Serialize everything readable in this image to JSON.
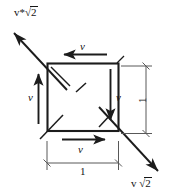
{
  "figure": {
    "background_color": "#ffffff",
    "stroke_color": "#1c1c1c",
    "dimension_stroke_color": "#585858",
    "text_color": "#151515",
    "width": 176,
    "height": 196
  },
  "shape": {
    "name": "square",
    "side_length_label": "1",
    "left": 47,
    "top": 63,
    "right": 119,
    "bottom": 131
  },
  "edge_vectors": [
    {
      "id": "top",
      "label": "v",
      "direction": "left",
      "position": "above-top-edge"
    },
    {
      "id": "right",
      "label": "v",
      "direction": "down",
      "position": "inside-right-edge"
    },
    {
      "id": "bottom",
      "label": "v",
      "direction": "right",
      "position": "below-bottom-edge"
    },
    {
      "id": "left",
      "label": "v",
      "direction": "up",
      "position": "outside-left-edge"
    }
  ],
  "diagonal_vectors": [
    {
      "id": "upper-left",
      "label_parts": {
        "prefix": "v*",
        "radical": "√",
        "radicand": "2"
      },
      "label_text": "v*√2",
      "direction": "up-left",
      "from": {
        "x": 67,
        "y": 90
      },
      "to": {
        "x": 13,
        "y": 32
      }
    },
    {
      "id": "lower-right",
      "label_parts": {
        "prefix": "v ",
        "radical": "√",
        "radicand": "2"
      },
      "label_text": "v √2",
      "direction": "down-right",
      "from": {
        "x": 99,
        "y": 107
      },
      "to": {
        "x": 159,
        "y": 172
      }
    }
  ],
  "dimensions": [
    {
      "id": "bottom-width",
      "label": "1",
      "orientation": "horizontal",
      "from": {
        "x": 47,
        "y": 163
      },
      "to": {
        "x": 118,
        "y": 163
      }
    },
    {
      "id": "right-height",
      "label": "1",
      "orientation": "vertical",
      "from": {
        "x": 146,
        "y": 66
      },
      "to": {
        "x": 146,
        "y": 134
      }
    }
  ],
  "corner_ticks": [
    {
      "id": "top-left-inner",
      "from": {
        "x": 51,
        "y": 67
      },
      "to": {
        "x": 70,
        "y": 86
      }
    },
    {
      "id": "center-dash",
      "from": {
        "x": 77,
        "y": 91
      },
      "to": {
        "x": 85,
        "y": 84
      }
    },
    {
      "id": "bottom-left-inner",
      "from": {
        "x": 40,
        "y": 138
      },
      "to": {
        "x": 62,
        "y": 116
      }
    },
    {
      "id": "bottom-right-inner",
      "from": {
        "x": 99,
        "y": 126
      },
      "to": {
        "x": 112,
        "y": 113
      }
    },
    {
      "id": "top-right-outer",
      "from": {
        "x": 118,
        "y": 62
      },
      "to": {
        "x": 124,
        "y": 56
      }
    }
  ],
  "labels": {
    "top_v": "v",
    "right_v": "v",
    "bottom_v": "v",
    "left_v": "v",
    "bottom_dimension": "1",
    "right_dimension": "1",
    "upper_left_diagonal_prefix": "v*",
    "upper_left_diagonal_radical": "√",
    "upper_left_diagonal_radicand": "2",
    "lower_right_diagonal_prefix": "v",
    "lower_right_diagonal_radical": "√",
    "lower_right_diagonal_radicand": "2"
  }
}
